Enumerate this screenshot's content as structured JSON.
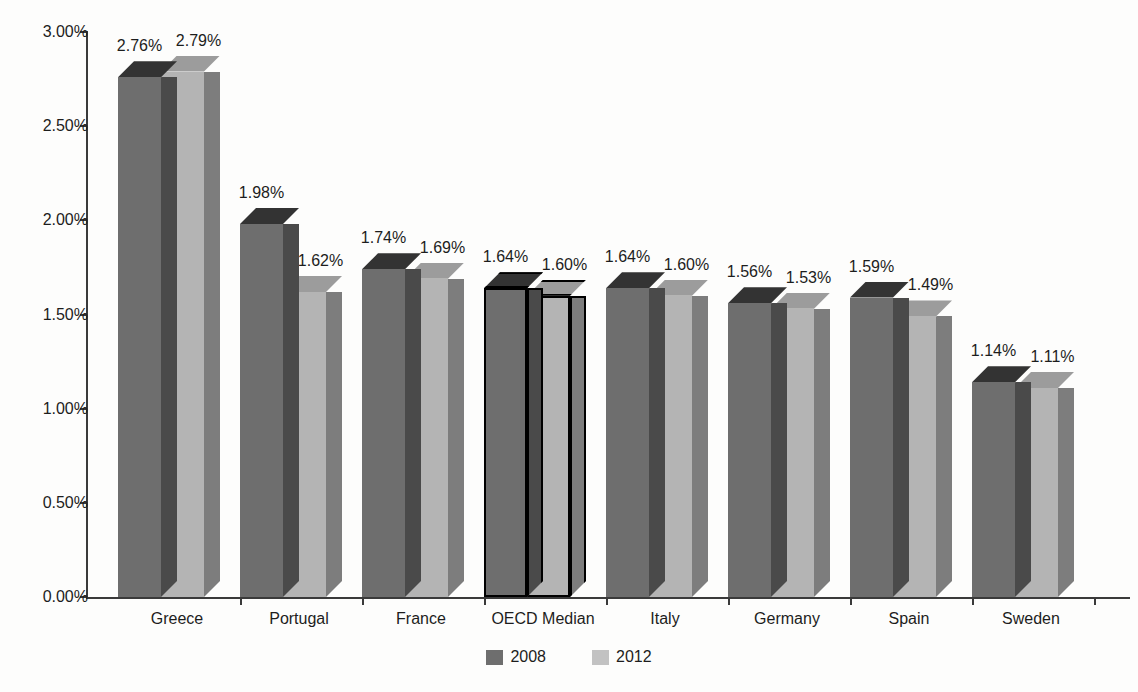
{
  "chart_data": {
    "type": "bar",
    "title": "",
    "xlabel": "",
    "ylabel": "",
    "ylim": [
      0,
      3.0
    ],
    "grid": false,
    "legend_position": "bottom-center",
    "value_suffix": "%",
    "categories": [
      "Greece",
      "Portugal",
      "France",
      "OECD Median",
      "Italy",
      "Germany",
      "Spain",
      "Sweden"
    ],
    "y_ticks": [
      "0.00%",
      "0.50%",
      "1.00%",
      "1.50%",
      "2.00%",
      "2.50%",
      "3.00%"
    ],
    "y_tick_values": [
      0.0,
      0.5,
      1.0,
      1.5,
      2.0,
      2.5,
      3.0
    ],
    "series": [
      {
        "name": "2008",
        "color": "#6e6e6e",
        "values": [
          2.76,
          1.98,
          1.74,
          1.64,
          1.64,
          1.56,
          1.59,
          1.14
        ],
        "labels": [
          "2.76%",
          "1.98%",
          "1.74%",
          "1.64%",
          "1.64%",
          "1.56%",
          "1.59%",
          "1.14%"
        ]
      },
      {
        "name": "2012",
        "color": "#b4b4b4",
        "values": [
          2.79,
          1.62,
          1.69,
          1.6,
          1.6,
          1.53,
          1.49,
          1.11
        ],
        "labels": [
          "2.79%",
          "1.62%",
          "1.69%",
          "1.60%",
          "1.60%",
          "1.53%",
          "1.49%",
          "1.11%"
        ]
      }
    ],
    "highlighted_category": "OECD Median"
  },
  "legend": {
    "items": [
      {
        "label": "2008",
        "swatch": "dark-gray-swatch"
      },
      {
        "label": "2012",
        "swatch": "light-gray-swatch"
      }
    ]
  }
}
